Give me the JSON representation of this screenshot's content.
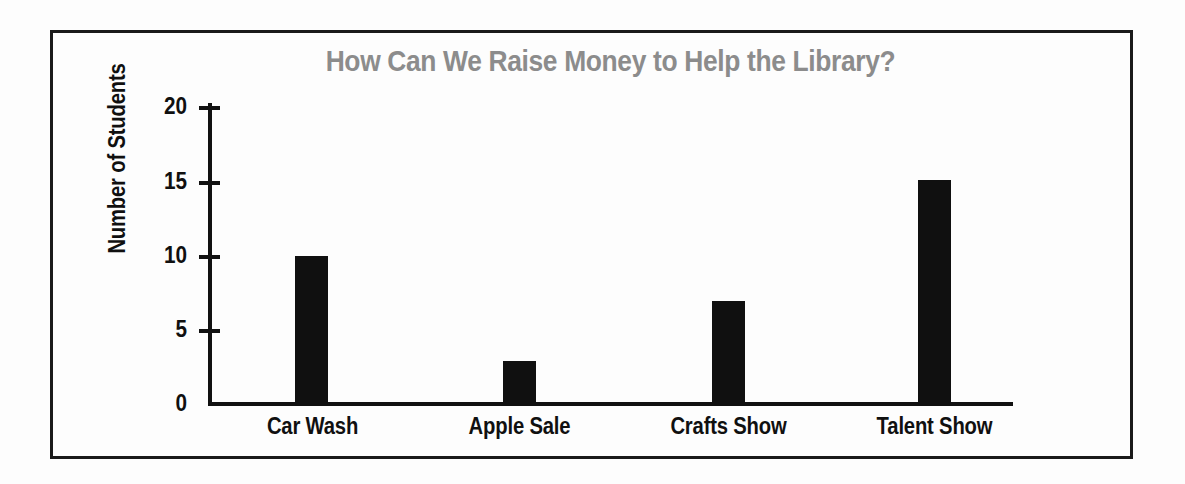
{
  "chart_data": {
    "type": "bar",
    "title": "How Can We Raise Money to Help the Library?",
    "xlabel": "",
    "ylabel": "Number of Students",
    "categories": [
      "Car Wash",
      "Apple Sale",
      "Crafts Show",
      "Talent Show"
    ],
    "values": [
      10,
      3,
      7,
      15
    ],
    "ylim": [
      0,
      20
    ],
    "yticks": [
      0,
      5,
      10,
      15,
      20
    ],
    "ytick_labels": [
      "0",
      "5",
      "10",
      "15",
      "20"
    ],
    "grid": false,
    "legend": null,
    "series": [
      {
        "name": "Number of Students",
        "values": [
          10,
          3,
          7,
          15
        ]
      }
    ],
    "colors": {
      "bar": "#101010",
      "title": "#8c8c8c",
      "axis": "#111111",
      "label": "#101010",
      "background": "#fdfdfd",
      "frame": "#1a1a1a"
    }
  }
}
